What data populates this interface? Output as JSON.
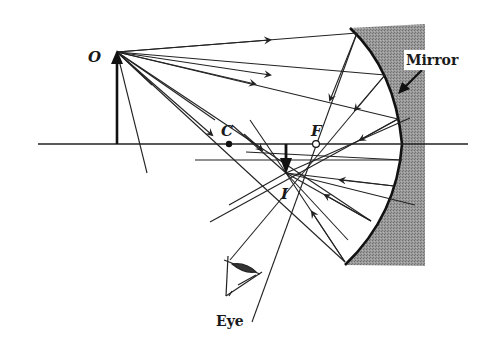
{
  "diagram": {
    "labels": {
      "object": "O",
      "center": "C",
      "focus": "F",
      "image": "I",
      "mirror": "Mirror",
      "eye": "Eye"
    },
    "colors": {
      "line": "#222222",
      "mirror_backing": "#8a8a8a",
      "background": "#ffffff"
    },
    "geometry": {
      "axis_y": 144,
      "object": {
        "x": 117,
        "y_base": 144,
        "y_tip": 52
      },
      "center_point": {
        "x": 229,
        "y": 144
      },
      "focal_point": {
        "x": 316,
        "y": 144
      },
      "image": {
        "x": 286,
        "y_base": 144,
        "y_tip": 173
      }
    }
  }
}
